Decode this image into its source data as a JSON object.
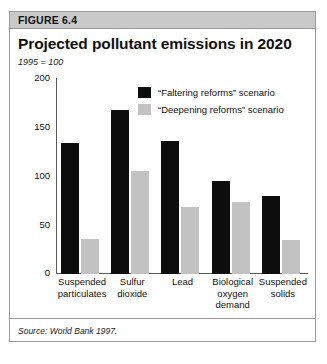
{
  "figure": {
    "number_label": "FIGURE 6.4",
    "title": "Projected pollutant emissions in 2020",
    "index_note": "1995 = 100",
    "source": "Source: World Bank 1997."
  },
  "colors": {
    "header_band": "#c9c9c9",
    "border": "#9a9a9a",
    "series_dark": "#0d0d0d",
    "series_light": "#c2c2c2",
    "axis": "#5a5a5a"
  },
  "chart_data": {
    "type": "bar",
    "title": "Projected pollutant emissions in 2020",
    "subtitle": "1995 = 100",
    "xlabel": "",
    "ylabel": "",
    "ylim": [
      0,
      200
    ],
    "yticks": [
      0,
      50,
      100,
      150,
      200
    ],
    "ytick_labels": [
      "0",
      "50",
      "100",
      "150",
      "200"
    ],
    "grid": false,
    "legend_position": "upper-center",
    "categories": [
      "Suspended particulates",
      "Sulfur dioxide",
      "Lead",
      "Biological oxygen demand",
      "Suspended solids"
    ],
    "category_lines": [
      [
        "Suspended",
        "particulates"
      ],
      [
        "Sulfur",
        "dioxide"
      ],
      [
        "Lead"
      ],
      [
        "Biological",
        "oxygen",
        "demand"
      ],
      [
        "Suspended",
        "solids"
      ]
    ],
    "series": [
      {
        "name": "“Faltering reforms” scenario",
        "color": "#0d0d0d",
        "values": [
          134,
          167,
          136,
          95,
          80
        ]
      },
      {
        "name": "“Deepening reforms” scenario",
        "color": "#c2c2c2",
        "values": [
          36,
          105,
          68,
          73,
          35
        ]
      }
    ],
    "source": "Source: World Bank 1997."
  }
}
